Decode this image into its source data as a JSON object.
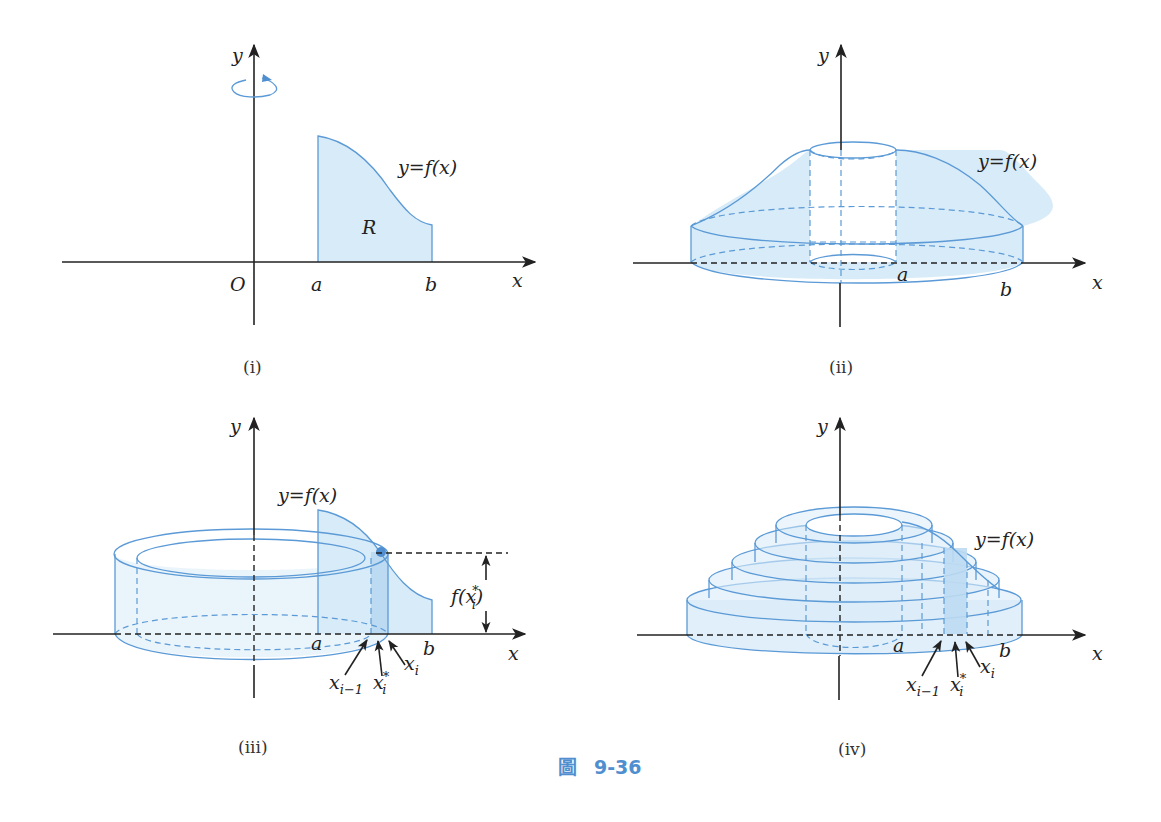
{
  "figure": {
    "caption_glyph": "圖",
    "caption_number": "9-36",
    "accent_color": "#4f8fd0",
    "fill_color": "#d8ebf8",
    "line_color": "#5b9ad6"
  },
  "panels": [
    {
      "id": "i",
      "label": "(i)",
      "x_axis": "x",
      "y_axis": "y",
      "origin": "O",
      "a": "a",
      "b": "b",
      "curve_label": "y=f(x)",
      "region_label": "R",
      "rotation_icon": "rotation-arrow-icon"
    },
    {
      "id": "ii",
      "label": "(ii)",
      "x_axis": "x",
      "y_axis": "y",
      "a": "a",
      "b": "b",
      "curve_label": "y=f(x)"
    },
    {
      "id": "iii",
      "label": "(iii)",
      "x_axis": "x",
      "y_axis": "y",
      "a": "a",
      "b": "b",
      "curve_label": "y=f(x)",
      "height_label": "f(x",
      "height_label_sup": "*",
      "height_label_sub": "i",
      "height_label_close": ")",
      "x_prev": "x",
      "x_prev_sub": "i−1",
      "x_star": "x",
      "x_star_sup": "*",
      "x_star_sub": "i",
      "x_i": "x",
      "x_i_sub": "i"
    },
    {
      "id": "iv",
      "label": "(iv)",
      "x_axis": "x",
      "y_axis": "y",
      "a": "a",
      "b": "b",
      "curve_label": "y=f(x)",
      "x_prev": "x",
      "x_prev_sub": "i−1",
      "x_star": "x",
      "x_star_sup": "*",
      "x_star_sub": "i",
      "x_i": "x",
      "x_i_sub": "i"
    }
  ]
}
